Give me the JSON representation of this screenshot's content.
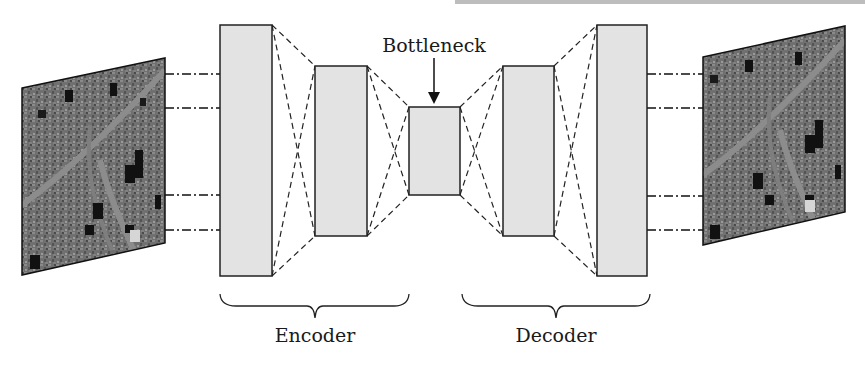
{
  "diagram": {
    "title_cropped": "",
    "bottleneck_label": "Bottleneck",
    "encoder_label": "Encoder",
    "decoder_label": "Decoder",
    "input_image": "satellite-image-input",
    "output_image": "satellite-image-reconstructed",
    "layers": [
      {
        "name": "encoder-layer-1",
        "x": 220,
        "y": 25,
        "w": 52,
        "h": 251
      },
      {
        "name": "encoder-layer-2",
        "x": 315,
        "y": 66,
        "w": 52,
        "h": 170
      },
      {
        "name": "bottleneck-layer",
        "x": 409,
        "y": 107,
        "w": 51,
        "h": 88
      },
      {
        "name": "decoder-layer-1",
        "x": 503,
        "y": 66,
        "w": 51,
        "h": 170
      },
      {
        "name": "decoder-layer-2",
        "x": 597,
        "y": 25,
        "w": 50,
        "h": 251
      }
    ],
    "colors": {
      "layer_fill": "#e3e3e3",
      "stroke": "#222222",
      "image_base": "#6e6e6e"
    }
  }
}
